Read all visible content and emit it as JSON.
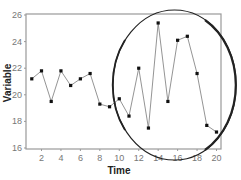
{
  "chart_data": {
    "type": "line",
    "title": "",
    "xlabel": "Time",
    "ylabel": "Variable",
    "xlim": [
      0.5,
      20.5
    ],
    "ylim": [
      16,
      26
    ],
    "xticks": [
      2,
      4,
      6,
      8,
      10,
      12,
      14,
      16,
      18,
      20
    ],
    "yticks": [
      16,
      18,
      20,
      22,
      24,
      26
    ],
    "grid": false,
    "legend": null,
    "x": [
      1,
      2,
      3,
      4,
      5,
      6,
      7,
      8,
      9,
      10,
      11,
      12,
      13,
      14,
      15,
      16,
      17,
      18,
      19,
      20
    ],
    "series": [
      {
        "name": "Variable",
        "values": [
          21.2,
          21.8,
          19.5,
          21.8,
          20.7,
          21.2,
          21.6,
          19.3,
          19.1,
          19.7,
          18.4,
          22.0,
          17.5,
          25.4,
          19.5,
          24.1,
          24.4,
          21.6,
          17.7,
          17.2
        ]
      }
    ],
    "annotations": [
      {
        "type": "ellipse",
        "description": "hand-drawn ellipse highlighting the high-variability region",
        "x_range": [
          9.5,
          21.5
        ],
        "y_range": [
          15.2,
          26.4
        ]
      }
    ]
  },
  "colors": {
    "line": "#888888",
    "marker": "#111111",
    "frame": "#999999",
    "ellipse": "#222222"
  }
}
